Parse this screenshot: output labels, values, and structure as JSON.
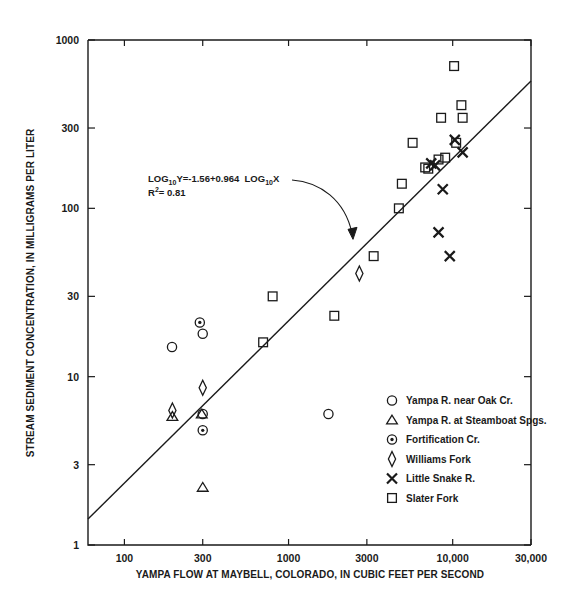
{
  "chart_data": {
    "type": "scatter",
    "title": "",
    "xlabel": "YAMPA FLOW AT MAYBELL, COLORADO, IN CUBIC FEET PER SECOND",
    "ylabel": "STREAM SEDIMENT CONCENTRATION, IN MILLIGRAMS PER LITER",
    "xscale": "log",
    "yscale": "log",
    "xlim": [
      60,
      30000
    ],
    "ylim": [
      1,
      1000
    ],
    "grid": false,
    "legend_position": "lower-right",
    "xticks": [
      {
        "value": 100,
        "label": "100"
      },
      {
        "value": 300,
        "label": "300"
      },
      {
        "value": 1000,
        "label": "1000"
      },
      {
        "value": 3000,
        "label": "3000"
      },
      {
        "value": 10000,
        "label": "10,000"
      },
      {
        "value": 30000,
        "label": "30,000"
      }
    ],
    "yticks": [
      {
        "value": 1,
        "label": "1"
      },
      {
        "value": 3,
        "label": "3"
      },
      {
        "value": 10,
        "label": "10"
      },
      {
        "value": 30,
        "label": "30"
      },
      {
        "value": 100,
        "label": "100"
      },
      {
        "value": 300,
        "label": "300"
      },
      {
        "value": 1000,
        "label": "1000"
      }
    ],
    "annotation": {
      "equation_prefix": "LOG",
      "equation_sub1": "10",
      "equation_mid": "Y=-1.56+0.964  LOG",
      "equation_sub2": "10",
      "equation_suffix": "X",
      "r2_prefix": "R",
      "r2_sup": "2",
      "r2_value": "= 0.81",
      "full_equation": "LOG10Y=-1.56+0.964  LOG10X",
      "r2_full": "R2= 0.81"
    },
    "regression": {
      "intercept": -1.56,
      "slope": 0.964,
      "r_squared": 0.81
    },
    "series": [
      {
        "name": "Yampa R. near Oak Cr.",
        "marker": "circle",
        "points": [
          {
            "x": 195,
            "y": 15
          },
          {
            "x": 300,
            "y": 18
          },
          {
            "x": 300,
            "y": 6.0
          },
          {
            "x": 1750,
            "y": 6.0
          }
        ]
      },
      {
        "name": "Yampa R. at Steamboat Spgs.",
        "marker": "triangle",
        "points": [
          {
            "x": 196,
            "y": 5.8
          },
          {
            "x": 296,
            "y": 6.0
          },
          {
            "x": 300,
            "y": 2.2
          }
        ]
      },
      {
        "name": "Fortification Cr.",
        "marker": "circle-dot",
        "points": [
          {
            "x": 288,
            "y": 21
          },
          {
            "x": 300,
            "y": 4.8
          }
        ]
      },
      {
        "name": "Williams Fork",
        "marker": "diamond",
        "points": [
          {
            "x": 196,
            "y": 6.3
          },
          {
            "x": 300,
            "y": 8.6
          },
          {
            "x": 2700,
            "y": 41
          }
        ]
      },
      {
        "name": "Little Snake R.",
        "marker": "x",
        "points": [
          {
            "x": 7400,
            "y": 185
          },
          {
            "x": 7800,
            "y": 180
          },
          {
            "x": 11500,
            "y": 215
          },
          {
            "x": 10300,
            "y": 255
          },
          {
            "x": 8700,
            "y": 130
          },
          {
            "x": 8200,
            "y": 72
          },
          {
            "x": 9600,
            "y": 52
          }
        ]
      },
      {
        "name": "Slater  Fork",
        "marker": "square",
        "points": [
          {
            "x": 800,
            "y": 30
          },
          {
            "x": 700,
            "y": 16
          },
          {
            "x": 1900,
            "y": 23
          },
          {
            "x": 3300,
            "y": 52
          },
          {
            "x": 4700,
            "y": 100
          },
          {
            "x": 4900,
            "y": 140
          },
          {
            "x": 5700,
            "y": 245
          },
          {
            "x": 6800,
            "y": 175
          },
          {
            "x": 7100,
            "y": 172
          },
          {
            "x": 8200,
            "y": 195
          },
          {
            "x": 8500,
            "y": 345
          },
          {
            "x": 9000,
            "y": 200
          },
          {
            "x": 10200,
            "y": 700
          },
          {
            "x": 11300,
            "y": 410
          },
          {
            "x": 11500,
            "y": 345
          },
          {
            "x": 10500,
            "y": 245
          }
        ]
      }
    ],
    "legend": [
      {
        "marker": "circle",
        "label": "Yampa R. near Oak Cr."
      },
      {
        "marker": "triangle",
        "label": "Yampa R. at  Steamboat Spgs."
      },
      {
        "marker": "circle-dot",
        "label": "Fortification Cr."
      },
      {
        "marker": "diamond",
        "label": "Williams Fork"
      },
      {
        "marker": "x",
        "label": "Little Snake R."
      },
      {
        "marker": "square",
        "label": "Slater  Fork"
      }
    ],
    "colors": {
      "ink": "#1a1a1a",
      "background": "#ffffff"
    }
  }
}
